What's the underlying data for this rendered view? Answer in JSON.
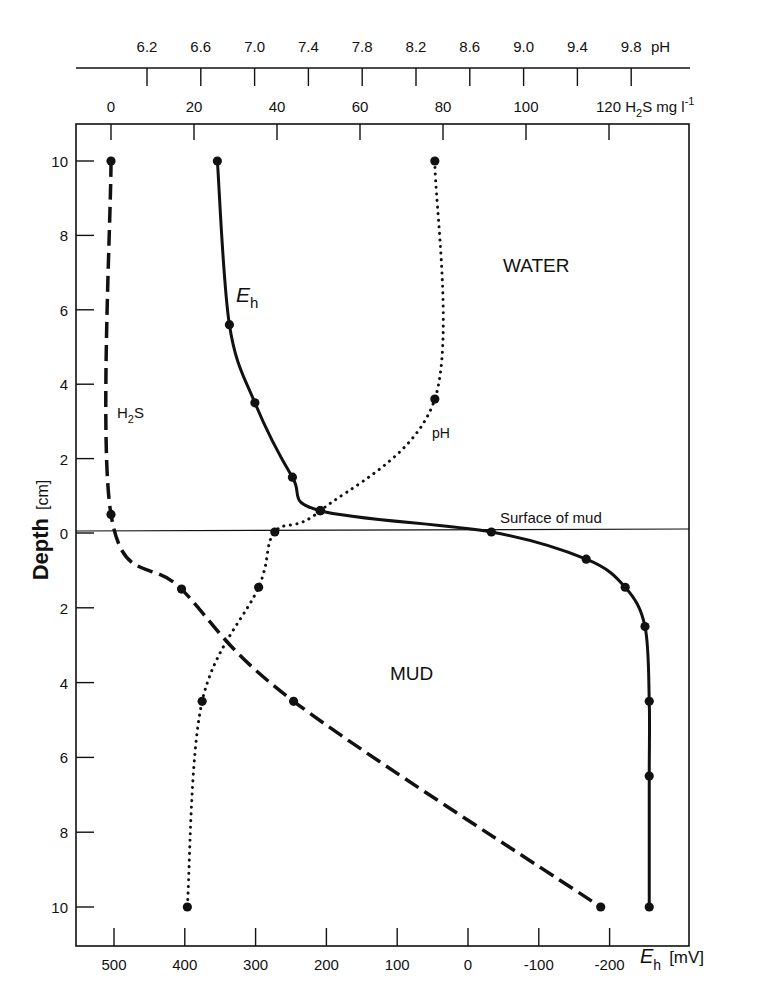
{
  "chart_data": {
    "type": "line",
    "title": "",
    "orientation": "depth profile (y = depth, multiple x-axes)",
    "y_axis": {
      "label": "Depth",
      "unit": "[cm]",
      "ticks_water": [
        "10",
        "8",
        "6",
        "4",
        "2"
      ],
      "ticks_center": "0",
      "ticks_mud": [
        "2",
        "4",
        "6",
        "8",
        "10"
      ],
      "range_water_cm": [
        0,
        10
      ],
      "range_mud_cm": [
        0,
        10
      ]
    },
    "x_axes": {
      "pH": {
        "label": "pH",
        "position": "top (outer)",
        "ticks": [
          "6.2",
          "6.6",
          "7.0",
          "7.4",
          "7.8",
          "8.2",
          "8.6",
          "9.0",
          "9.4",
          "9.8"
        ],
        "range": [
          6.2,
          9.8
        ]
      },
      "H2S": {
        "label": "H2S mg l-1",
        "label_main": "120 H",
        "label_sub": "2",
        "label_rest": "S mg l",
        "label_sup": "-1",
        "position": "top (inner)",
        "ticks": [
          "0",
          "20",
          "40",
          "60",
          "80",
          "100"
        ],
        "range": [
          0,
          120
        ]
      },
      "Eh": {
        "label": "Eh",
        "label_main": "E",
        "label_sub": "h",
        "unit": "[mV]",
        "position": "bottom",
        "ticks": [
          "500",
          "400",
          "300",
          "200",
          "100",
          "0",
          "-100",
          "-200"
        ],
        "range": [
          500,
          -200
        ]
      }
    },
    "annotations": {
      "water": "WATER",
      "mud": "MUD",
      "surface": "Surface of mud",
      "eh_curve_label_main": "E",
      "eh_curve_label_sub": "h",
      "ph_curve_label": "pH",
      "h2s_curve_label_main": "H",
      "h2s_curve_label_sub": "2",
      "h2s_curve_label_rest": "S"
    },
    "series": [
      {
        "name": "Eh",
        "unit": "mV",
        "line_style": "solid",
        "points": [
          {
            "zone": "water",
            "depth_cm": 10.0,
            "value": 354
          },
          {
            "zone": "water",
            "depth_cm": 5.6,
            "value": 337
          },
          {
            "zone": "water",
            "depth_cm": 3.5,
            "value": 301
          },
          {
            "zone": "water",
            "depth_cm": 1.5,
            "value": 248
          },
          {
            "zone": "water",
            "depth_cm": 0.6,
            "value": 209
          },
          {
            "zone": "surface",
            "depth_cm": 0.0,
            "value": -33
          },
          {
            "zone": "mud",
            "depth_cm": 0.7,
            "value": -167
          },
          {
            "zone": "mud",
            "depth_cm": 1.45,
            "value": -222
          },
          {
            "zone": "mud",
            "depth_cm": 2.5,
            "value": -250
          },
          {
            "zone": "mud",
            "depth_cm": 4.5,
            "value": -256
          },
          {
            "zone": "mud",
            "depth_cm": 6.5,
            "value": -256
          },
          {
            "zone": "mud",
            "depth_cm": 10.0,
            "value": -256
          }
        ]
      },
      {
        "name": "pH",
        "unit": "pH",
        "line_style": "dotted",
        "points": [
          {
            "zone": "water",
            "depth_cm": 10.0,
            "value": 8.34
          },
          {
            "zone": "water",
            "depth_cm": 3.6,
            "value": 8.34
          },
          {
            "zone": "water",
            "depth_cm": 0.6,
            "value": 7.49
          },
          {
            "zone": "surface",
            "depth_cm": 0.0,
            "value": 7.15
          },
          {
            "zone": "mud",
            "depth_cm": 1.45,
            "value": 7.03
          },
          {
            "zone": "mud",
            "depth_cm": 4.5,
            "value": 6.61
          },
          {
            "zone": "mud",
            "depth_cm": 10.0,
            "value": 6.5
          }
        ]
      },
      {
        "name": "H2S",
        "unit": "mg l-1",
        "line_style": "dashed",
        "points": [
          {
            "zone": "water",
            "depth_cm": 10.0,
            "value": 0
          },
          {
            "zone": "water",
            "depth_cm": 0.5,
            "value": 0
          },
          {
            "zone": "mud",
            "depth_cm": 1.5,
            "value": 17
          },
          {
            "zone": "mud",
            "depth_cm": 4.5,
            "value": 44
          },
          {
            "zone": "mud",
            "depth_cm": 10.0,
            "value": 118
          }
        ]
      }
    ],
    "grid": false,
    "legend": "none (curves labeled inline)"
  }
}
